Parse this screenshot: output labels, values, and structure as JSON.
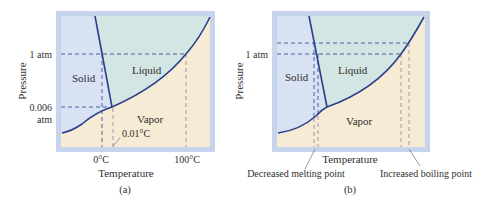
{
  "colors": {
    "frame": "#c7d5ec",
    "solid": "#d8e2f3",
    "liquid": "#d4e6e3",
    "vapor": "#f6ebd4",
    "curve": "#2c3f8c",
    "dash": "#3e4f9a",
    "dash_warm": "#9b8aa0"
  },
  "panel_a": {
    "caption": "(a)",
    "x_label": "Temperature",
    "y_label": "Pressure",
    "y_ticks": {
      "one_atm": "1 atm",
      "triple_top": "0.006",
      "triple_bottom": "atm"
    },
    "x_ticks": {
      "melting": "0°C",
      "boiling": "100°C"
    },
    "regions": {
      "solid": "Solid",
      "liquid": "Liquid",
      "vapor": "Vapor"
    },
    "annotation": "0.01°C"
  },
  "panel_b": {
    "caption": "(b)",
    "x_label": "Temperature",
    "y_label": "Pressure",
    "y_ticks": {
      "one_atm": "1 atm"
    },
    "regions": {
      "solid": "Solid",
      "liquid": "Liquid",
      "vapor": "Vapor"
    },
    "annotations": {
      "melting": "Decreased melting point",
      "boiling": "Increased boiling point"
    }
  }
}
